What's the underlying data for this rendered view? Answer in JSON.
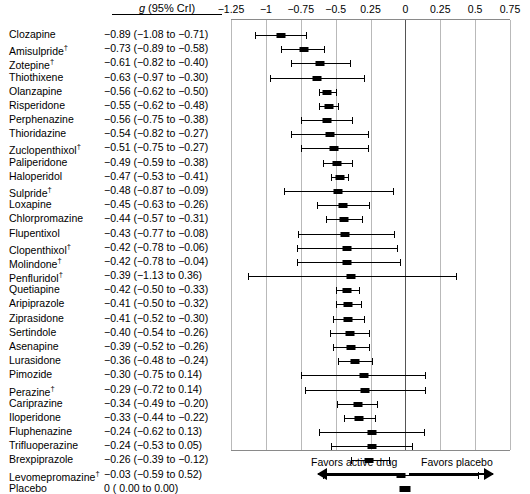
{
  "header": {
    "value_column_header": "g (95% CrI)",
    "value_column_header_italic_part": "g",
    "value_column_header_rest": " (95% CrI)"
  },
  "axis": {
    "tick_labels": [
      "−1.25",
      "−1",
      "−0.75",
      "−0.5",
      "0.25",
      "0",
      "0.25",
      "0.5",
      "0.75"
    ],
    "tick_values": [
      -1.25,
      -1.0,
      -0.75,
      -0.5,
      -0.25,
      0,
      0.25,
      0.5,
      0.75
    ],
    "xlim": [
      -1.25,
      0.75
    ],
    "zero_line_value": 0
  },
  "footer": {
    "favors_left": "Favors active drug",
    "favors_right": "Favors placebo",
    "arrow_left_icon": "left-arrow-icon",
    "arrow_right_icon": "right-arrow-icon"
  },
  "chart_data": {
    "type": "forest",
    "title": "",
    "xlabel": "",
    "ylabel": "",
    "xlim": [
      -1.25,
      0.75
    ],
    "grid": true,
    "legend": "none",
    "value_label": "g (95% CrI)",
    "effect_measure": "Hedges' g",
    "interval_type": "95% CrI",
    "reference_line": 0,
    "dagger_note": "†",
    "rows": [
      {
        "label": "Clozapine",
        "dagger": false,
        "estimate": -0.89,
        "lower": -1.08,
        "upper": -0.71,
        "text": "−0.89 (−1.08 to −0.71)"
      },
      {
        "label": "Amisulpride",
        "dagger": true,
        "estimate": -0.73,
        "lower": -0.89,
        "upper": -0.58,
        "text": "−0.73 (−0.89 to −0.58)"
      },
      {
        "label": "Zotepine",
        "dagger": true,
        "estimate": -0.61,
        "lower": -0.82,
        "upper": -0.4,
        "text": "−0.61 (−0.82 to −0.40)"
      },
      {
        "label": "Thiothixene",
        "dagger": false,
        "estimate": -0.63,
        "lower": -0.97,
        "upper": -0.3,
        "text": "−0.63 (−0.97 to −0.30)"
      },
      {
        "label": "Olanzapine",
        "dagger": false,
        "estimate": -0.56,
        "lower": -0.62,
        "upper": -0.5,
        "text": "−0.56 (−0.62 to −0.50)"
      },
      {
        "label": "Risperidone",
        "dagger": false,
        "estimate": -0.55,
        "lower": -0.62,
        "upper": -0.48,
        "text": "−0.55 (−0.62 to −0.48)"
      },
      {
        "label": "Perphenazine",
        "dagger": false,
        "estimate": -0.56,
        "lower": -0.75,
        "upper": -0.38,
        "text": "−0.56 (−0.75 to −0.38)"
      },
      {
        "label": "Thioridazine",
        "dagger": false,
        "estimate": -0.54,
        "lower": -0.82,
        "upper": -0.27,
        "text": "−0.54 (−0.82 to −0.27)"
      },
      {
        "label": "Zuclopenthixol",
        "dagger": true,
        "estimate": -0.51,
        "lower": -0.75,
        "upper": -0.27,
        "text": "−0.51 (−0.75 to −0.27)"
      },
      {
        "label": "Paliperidone",
        "dagger": false,
        "estimate": -0.49,
        "lower": -0.59,
        "upper": -0.38,
        "text": "−0.49 (−0.59 to −0.38)"
      },
      {
        "label": "Haloperidol",
        "dagger": false,
        "estimate": -0.47,
        "lower": -0.53,
        "upper": -0.41,
        "text": "−0.47 (−0.53 to −0.41)"
      },
      {
        "label": "Sulpride",
        "dagger": true,
        "estimate": -0.48,
        "lower": -0.87,
        "upper": -0.09,
        "text": "−0.48 (−0.87 to −0.09)"
      },
      {
        "label": "Loxapine",
        "dagger": false,
        "estimate": -0.45,
        "lower": -0.63,
        "upper": -0.26,
        "text": "−0.45 (−0.63 to −0.26)"
      },
      {
        "label": "Chlorpromazine",
        "dagger": false,
        "estimate": -0.44,
        "lower": -0.57,
        "upper": -0.31,
        "text": "−0.44 (−0.57 to −0.31)"
      },
      {
        "label": "Flupentixol",
        "dagger": false,
        "estimate": -0.43,
        "lower": -0.77,
        "upper": -0.08,
        "text": "−0.43 (−0.77 to −0.08)"
      },
      {
        "label": "Clopenthixol",
        "dagger": true,
        "estimate": -0.42,
        "lower": -0.78,
        "upper": -0.06,
        "text": "−0.42 (−0.78 to −0.06)"
      },
      {
        "label": "Molindone",
        "dagger": true,
        "estimate": -0.42,
        "lower": -0.78,
        "upper": -0.04,
        "text": "−0.42 (−0.78 to −0.04)"
      },
      {
        "label": "Penfluridol",
        "dagger": true,
        "estimate": -0.39,
        "lower": -1.13,
        "upper": 0.36,
        "text": "−0.39 (−1.13 to 0.36)"
      },
      {
        "label": "Quetiapine",
        "dagger": false,
        "estimate": -0.42,
        "lower": -0.5,
        "upper": -0.33,
        "text": "−0.42 (−0.50 to −0.33)"
      },
      {
        "label": "Aripiprazole",
        "dagger": false,
        "estimate": -0.41,
        "lower": -0.5,
        "upper": -0.32,
        "text": "−0.41 (−0.50 to −0.32)"
      },
      {
        "label": "Ziprasidone",
        "dagger": false,
        "estimate": -0.41,
        "lower": -0.52,
        "upper": -0.3,
        "text": "−0.41 (−0.52 to −0.30)"
      },
      {
        "label": "Sertindole",
        "dagger": false,
        "estimate": -0.4,
        "lower": -0.54,
        "upper": -0.26,
        "text": "−0.40 (−0.54 to −0.26)"
      },
      {
        "label": "Asenapine",
        "dagger": false,
        "estimate": -0.39,
        "lower": -0.52,
        "upper": -0.26,
        "text": "−0.39 (−0.52 to −0.26)"
      },
      {
        "label": "Lurasidone",
        "dagger": false,
        "estimate": -0.36,
        "lower": -0.48,
        "upper": -0.24,
        "text": "−0.36 (−0.48 to −0.24)"
      },
      {
        "label": "Pimozide",
        "dagger": false,
        "estimate": -0.3,
        "lower": -0.75,
        "upper": 0.14,
        "text": "−0.30 (−0.75 to 0.14)"
      },
      {
        "label": "Perazine",
        "dagger": true,
        "estimate": -0.29,
        "lower": -0.72,
        "upper": 0.14,
        "text": "−0.29 (−0.72 to 0.14)"
      },
      {
        "label": "Cariprazine",
        "dagger": false,
        "estimate": -0.34,
        "lower": -0.49,
        "upper": -0.2,
        "text": "−0.34 (−0.49 to −0.20)"
      },
      {
        "label": "Iloperidone",
        "dagger": false,
        "estimate": -0.33,
        "lower": -0.44,
        "upper": -0.22,
        "text": "−0.33 (−0.44 to −0.22)"
      },
      {
        "label": "Fluphenazine",
        "dagger": false,
        "estimate": -0.24,
        "lower": -0.62,
        "upper": 0.13,
        "text": "−0.24 (−0.62 to 0.13)"
      },
      {
        "label": "Trifluoperazine",
        "dagger": false,
        "estimate": -0.24,
        "lower": -0.53,
        "upper": 0.05,
        "text": "−0.24 (−0.53 to 0.05)"
      },
      {
        "label": "Brexpiprazole",
        "dagger": false,
        "estimate": -0.26,
        "lower": -0.39,
        "upper": -0.12,
        "text": "−0.26 (−0.39 to −0.12)"
      },
      {
        "label": "Levomepromazine",
        "dagger": true,
        "estimate": -0.03,
        "lower": -0.59,
        "upper": 0.52,
        "text": "−0.03 (−0.59 to 0.52)"
      },
      {
        "label": "Placebo",
        "dagger": false,
        "estimate": 0.0,
        "lower": 0.0,
        "upper": 0.0,
        "text": "0     ( 0.00 to  0.00)"
      }
    ]
  }
}
